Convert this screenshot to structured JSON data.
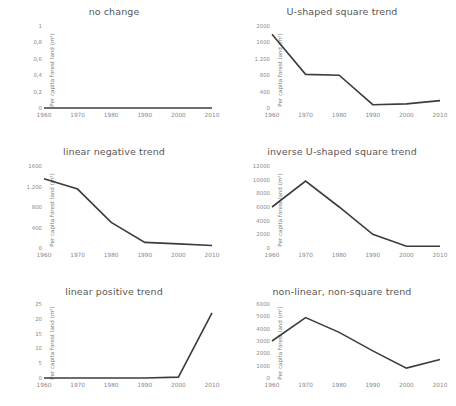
{
  "figure": {
    "ylabel": "Per capita forest land (m²)",
    "x_ticks": [
      "1960",
      "1970",
      "1980",
      "1990",
      "2000",
      "2010"
    ],
    "line_color": "#3c3c3c",
    "background": "#ffffff"
  },
  "chart_data": [
    {
      "type": "line",
      "title": "no change",
      "xlabel": "",
      "ylabel": "Per capita forest land (m²)",
      "x": [
        1960,
        1970,
        1980,
        1990,
        2000,
        2010
      ],
      "categories": [
        "1960",
        "1970",
        "1980",
        "1990",
        "2000",
        "2010"
      ],
      "values": [
        0,
        0,
        0,
        0,
        0,
        0
      ],
      "ylim": [
        0,
        1
      ],
      "ytick_labels": [
        "0",
        "0,2",
        "0,4",
        "0,6",
        "0,8",
        "1"
      ],
      "ytick_values": [
        0,
        0.2,
        0.4,
        0.6,
        0.8,
        1
      ],
      "grid": false,
      "legend": "none"
    },
    {
      "type": "line",
      "title": "U-shaped square trend",
      "xlabel": "",
      "ylabel": "Per capita forest land (m²)",
      "x": [
        1960,
        1970,
        1980,
        1990,
        2000,
        2010
      ],
      "categories": [
        "1960",
        "1970",
        "1980",
        "1990",
        "2000",
        "2010"
      ],
      "values": [
        1800,
        820,
        800,
        80,
        100,
        180
      ],
      "ylim": [
        0,
        2000
      ],
      "ytick_labels": [
        "0",
        "400",
        "800",
        "1.200",
        "1600",
        "2000"
      ],
      "ytick_values": [
        0,
        400,
        800,
        1200,
        1600,
        2000
      ],
      "grid": false,
      "legend": "none"
    },
    {
      "type": "line",
      "title": "linear negative trend",
      "xlabel": "",
      "ylabel": "Per capita forest land (m²)",
      "x": [
        1960,
        1970,
        1980,
        1990,
        2000,
        2010
      ],
      "categories": [
        "1960",
        "1970",
        "1980",
        "1990",
        "2000",
        "2010"
      ],
      "values": [
        1350,
        1150,
        500,
        110,
        80,
        50
      ],
      "ylim": [
        0,
        1600
      ],
      "ytick_labels": [
        "0",
        "400",
        "800",
        "1.200",
        "1600"
      ],
      "ytick_values": [
        0,
        400,
        800,
        1200,
        1600
      ],
      "grid": false,
      "legend": "none"
    },
    {
      "type": "line",
      "title": "inverse U-shaped square trend",
      "xlabel": "",
      "ylabel": "Per capita forest land (m²)",
      "x": [
        1960,
        1970,
        1980,
        1990,
        2000,
        2010
      ],
      "categories": [
        "1960",
        "1970",
        "1980",
        "1990",
        "2000",
        "2010"
      ],
      "values": [
        6000,
        9800,
        6000,
        2000,
        250,
        250
      ],
      "ylim": [
        0,
        12000
      ],
      "ytick_labels": [
        "0",
        "2000",
        "4000",
        "6000",
        "8000",
        "10000",
        "12000"
      ],
      "ytick_values": [
        0,
        2000,
        4000,
        6000,
        8000,
        10000,
        12000
      ],
      "grid": false,
      "legend": "none"
    },
    {
      "type": "line",
      "title": "linear positive trend",
      "xlabel": "",
      "ylabel": "Per capita forest land (m²)",
      "x": [
        1960,
        1970,
        1980,
        1990,
        2000,
        2010
      ],
      "categories": [
        "1960",
        "1970",
        "1980",
        "1990",
        "2000",
        "2010"
      ],
      "values": [
        0,
        0,
        0,
        0,
        0.3,
        22
      ],
      "ylim": [
        0,
        25
      ],
      "ytick_labels": [
        "0",
        "5",
        "10",
        "15",
        "20",
        "25"
      ],
      "ytick_values": [
        0,
        5,
        10,
        15,
        20,
        25
      ],
      "grid": false,
      "legend": "none"
    },
    {
      "type": "line",
      "title": "non-linear, non-square trend",
      "xlabel": "",
      "ylabel": "Per capita forest land (m²)",
      "x": [
        1960,
        1970,
        1980,
        1990,
        2000,
        2010
      ],
      "categories": [
        "1960",
        "1970",
        "1980",
        "1990",
        "2000",
        "2010"
      ],
      "values": [
        3000,
        4900,
        3700,
        2200,
        800,
        1500
      ],
      "ylim": [
        0,
        6000
      ],
      "ytick_labels": [
        "0",
        "1000",
        "2000",
        "3000",
        "4000",
        "5000",
        "6000"
      ],
      "ytick_values": [
        0,
        1000,
        2000,
        3000,
        4000,
        5000,
        6000
      ],
      "grid": false,
      "legend": "none"
    }
  ]
}
